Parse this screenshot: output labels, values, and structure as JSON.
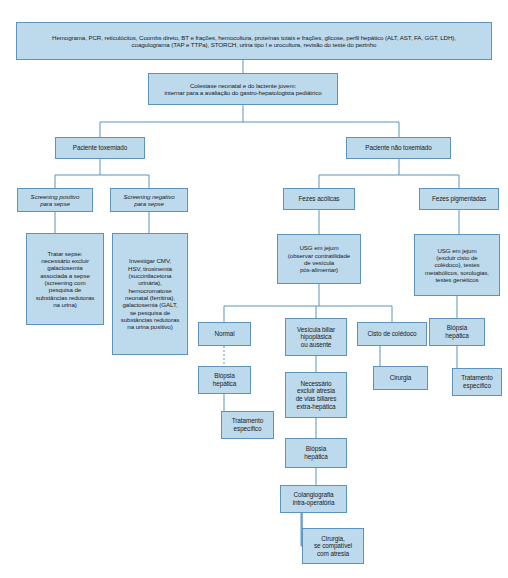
{
  "figure": {
    "accent_color": "#bdd9ec",
    "border_color": "#5b93bc",
    "text_color": "#1c1c1c",
    "background": "#ffffff"
  },
  "nodes": {
    "exames_iniciais": {
      "label": "Hemograma, PCR, reticulócitos, Coombs direto, BT e frações, hemocultura, proteínas totais e frações, glicose, perfil hepático (ALT, AST, FA, GGT, LDH),\ncoagulograma (TAP e TTPa), STORCH, urina tipo I e urocultura, revisão do teste do pezinho",
      "x": 16,
      "y": 22,
      "w": 476,
      "h": 38,
      "font": 6.2,
      "italic": false
    },
    "colestase": {
      "label": "Colestase neonatal e do lactente jovem:\ninternar para a avaliação do gastro-hepatologista pediátrico",
      "x": 148,
      "y": 73,
      "w": 190,
      "h": 32,
      "font": 6.2,
      "italic": false
    },
    "paciente_toxemiado": {
      "label": "Paciente toxemiado",
      "x": 55,
      "y": 137,
      "w": 90,
      "h": 22,
      "font": 6.4,
      "italic": false
    },
    "paciente_nao_toxemiado": {
      "label": "Paciente não toxemiado",
      "x": 346,
      "y": 137,
      "w": 105,
      "h": 22,
      "font": 6.4,
      "italic": false
    },
    "screening_positivo": {
      "label": "Screening positivo\npara sepse",
      "x": 17,
      "y": 188,
      "w": 76,
      "h": 24,
      "font": 6.2,
      "italic": true
    },
    "screening_negativo": {
      "label": "Screening negativo\npara sepse",
      "x": 110,
      "y": 188,
      "w": 78,
      "h": 24,
      "font": 6.2,
      "italic": true
    },
    "tratar_sepse": {
      "label": "Tratar sepse:\nnecessário excluir\ngalactosemia\nassociada a sepse\n(screening com\npesquisa de\nsubstâncias redutoras\nna urina)",
      "x": 26,
      "y": 233,
      "w": 78,
      "h": 92,
      "font": 6.2,
      "italic": false
    },
    "investigar_cmv": {
      "label": "Investigar CMV,\nHSV, tirosinemia\n(succinilacetona\nurinária),\nhemocromatose\nneonatal (ferritina),\ngalactosemia (GALT,\nse pesquisa de\nsubstâncias redutoras\nna urina positivo)",
      "x": 112,
      "y": 233,
      "w": 76,
      "h": 122,
      "font": 6.2,
      "italic": false
    },
    "fezes_acolicas": {
      "label": "Fezes acólicas",
      "x": 283,
      "y": 188,
      "w": 72,
      "h": 22,
      "font": 6.4,
      "italic": false
    },
    "fezes_pigmentadas": {
      "label": "Fezes pigmentadas",
      "x": 419,
      "y": 188,
      "w": 80,
      "h": 22,
      "font": 6.4,
      "italic": false
    },
    "usg_jejum_contratilidade": {
      "label": "USG em jejum\n(observar contratilidade\nde vesícula\npós-alimentar)",
      "x": 277,
      "y": 234,
      "w": 84,
      "h": 50,
      "font": 6.2,
      "italic": false
    },
    "usg_jejum_cisto": {
      "label": "USG em jejum\n(excluir cisto de\ncolédoco), testes\nmetabólicos, sorologias,\ntestes genéticos",
      "x": 414,
      "y": 234,
      "w": 86,
      "h": 62,
      "font": 6.2,
      "italic": false
    },
    "biopsia_hepatica_direita": {
      "label": "Biópsia\nhepática",
      "x": 429,
      "y": 318,
      "w": 56,
      "h": 28,
      "font": 6.4,
      "italic": false
    },
    "tratamento_especifico_direita": {
      "label": "Tratamento\nespecífico",
      "x": 452,
      "y": 368,
      "w": 50,
      "h": 28,
      "font": 6.4,
      "italic": false
    },
    "normal": {
      "label": "Normal",
      "x": 198,
      "y": 322,
      "w": 53,
      "h": 24,
      "font": 6.4,
      "italic": false
    },
    "biopsia_hepatica_normal": {
      "label": "Biópsia\nhepática",
      "x": 198,
      "y": 366,
      "w": 53,
      "h": 28,
      "font": 6.4,
      "italic": false
    },
    "tratamento_especifico_normal": {
      "label": "Tratamento\nespecífico",
      "x": 221,
      "y": 411,
      "w": 53,
      "h": 28,
      "font": 6.4,
      "italic": false
    },
    "vesicula_biliar": {
      "label": "Vesícula biliar\nhipoplásica\nou ausente",
      "x": 285,
      "y": 318,
      "w": 62,
      "h": 38,
      "font": 6.4,
      "italic": false
    },
    "necessario_excluir": {
      "label": "Necessário\nexcluir atresia\nde vias biliares\nextra-hepática",
      "x": 285,
      "y": 372,
      "w": 62,
      "h": 46,
      "font": 6.4,
      "italic": false
    },
    "biopsia_hepatica_meio": {
      "label": "Biópsia\nhepática",
      "x": 285,
      "y": 438,
      "w": 62,
      "h": 30,
      "font": 6.4,
      "italic": false
    },
    "colangiografia": {
      "label": "Colangiografia\nintra-operatória",
      "x": 280,
      "y": 485,
      "w": 67,
      "h": 28,
      "font": 6.4,
      "italic": false
    },
    "cirurgia_atresia": {
      "label": "Cirurgia,\nse compatível\ncom atresia",
      "x": 302,
      "y": 528,
      "w": 62,
      "h": 36,
      "font": 6.4,
      "italic": false
    },
    "cisto_coledoco": {
      "label": "Cisto de colédoco",
      "x": 357,
      "y": 322,
      "w": 70,
      "h": 24,
      "font": 6.4,
      "italic": false
    },
    "cirurgia": {
      "label": "Cirurgia",
      "x": 373,
      "y": 366,
      "w": 55,
      "h": 24,
      "font": 6.4,
      "italic": false
    }
  }
}
